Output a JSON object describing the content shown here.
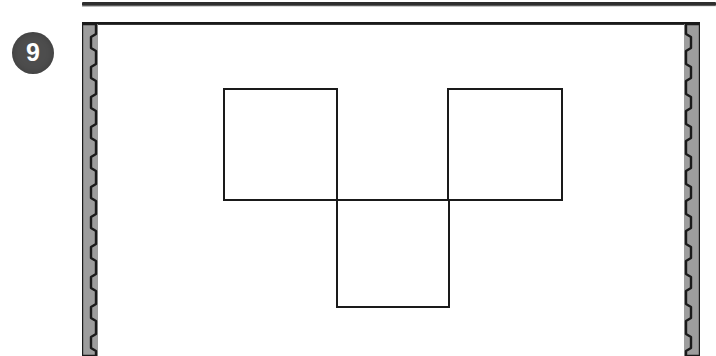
{
  "page": {
    "width": 716,
    "height": 356,
    "background_color": "#ffffff"
  },
  "previous_panel": {
    "name": "partial-rule",
    "description": "bottom border rule of the preceding exercise panel",
    "color": "#1d1d1d"
  },
  "question": {
    "number": "9",
    "badge_background_color": "#4d4d4d",
    "badge_text_color": "#ffffff"
  },
  "panel": {
    "background_color": "#ffffff",
    "border_color": "#1a1a1a",
    "band_color": "#9d9d9d",
    "band_edge_color": "#1a1a1a",
    "band_scallop_count": 10
  },
  "figure": {
    "type": "polyomino-net",
    "name": "three-square-net",
    "stroke_color": "#1a1a1a",
    "fill_color": "none",
    "stroke_width": 2,
    "square_size": 113,
    "squares": [
      {
        "name": "top-left-square",
        "x": 142,
        "y": 67,
        "w": 113,
        "h": 111
      },
      {
        "name": "top-right-square",
        "x": 366,
        "y": 67,
        "w": 114,
        "h": 111
      },
      {
        "name": "bottom-middle-square",
        "x": 255,
        "y": 178,
        "w": 112,
        "h": 107
      }
    ],
    "outline_points": "142,67 255,67 255,178 367,178 367,285 255,285 255,178 142,178 142,67",
    "shared_edge_line": {
      "x1": 142,
      "y1": 178,
      "x2": 480,
      "y2": 178
    },
    "vertical_lines": [
      {
        "x": 255,
        "y1": 67,
        "y2": 285
      },
      {
        "x": 367,
        "y1": 67,
        "y2": 285
      }
    ]
  }
}
